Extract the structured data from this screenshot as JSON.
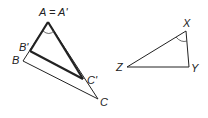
{
  "diagram": {
    "left_figure": {
      "labels": {
        "A": "A = A'",
        "B_prime": "B'",
        "B": "B",
        "C_prime": "C'",
        "C": "C"
      },
      "vertices": {
        "A": [
          48,
          22
        ],
        "B_prime": [
          30,
          51
        ],
        "B": [
          23,
          61
        ],
        "C_prime": [
          83,
          79
        ],
        "C": [
          98,
          99
        ]
      },
      "inner_triangle": "A'B'C' (bold)",
      "outer_triangle": "ABC (thin)",
      "angle_mark": "arc at A"
    },
    "right_figure": {
      "labels": {
        "X": "X",
        "Y": "Y",
        "Z": "Z"
      },
      "vertices": {
        "X": [
          186,
          31
        ],
        "Y": [
          189,
          67
        ],
        "Z": [
          127,
          67
        ]
      },
      "angle_mark": "arc at X"
    },
    "colors": {
      "stroke": "#222222",
      "background": "#ffffff"
    }
  }
}
